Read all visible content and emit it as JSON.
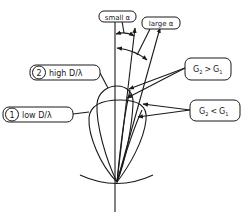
{
  "diagram": {
    "labels": {
      "small_alpha": "small α",
      "large_alpha": "large α",
      "high": {
        "number": "2",
        "text": "high D/λ"
      },
      "low": {
        "number": "1",
        "text": "low D/λ"
      },
      "g_greater": {
        "g2": "G",
        "sub2": "2",
        "op": ">",
        "g1": "G",
        "sub1": "1"
      },
      "g_less": {
        "g2": "G",
        "sub2": "2",
        "op": "<",
        "g1": "G",
        "sub1": "1"
      }
    },
    "colors": {
      "line": "#1a1a1a",
      "background": "#ffffff"
    }
  }
}
